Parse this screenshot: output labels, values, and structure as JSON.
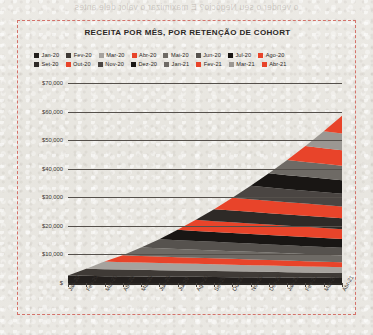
{
  "page": {
    "bleed_text": "o vender o seu Negócio? E maximizar o valor dele antes"
  },
  "chart_frame": {
    "border_color": "#d4726a"
  },
  "legend": {
    "rows": [
      [
        {
          "label": "Jan-20",
          "color": "#231f1d"
        },
        {
          "label": "Fev-20",
          "color": "#3f3a36"
        },
        {
          "label": "Mar-20",
          "color": "#a6a29d"
        },
        {
          "label": "Abr-20",
          "color": "#e8442a"
        },
        {
          "label": "Mai-20",
          "color": "#6e6a65"
        },
        {
          "label": "Jun-20",
          "color": "#56524e"
        },
        {
          "label": "Jul-20",
          "color": "#191614"
        },
        {
          "label": "Ago-20",
          "color": "#e8442a"
        }
      ],
      [
        {
          "label": "Set-20",
          "color": "#2e2a27"
        },
        {
          "label": "Out-20",
          "color": "#e8442a"
        },
        {
          "label": "Nov-20",
          "color": "#4a4542"
        },
        {
          "label": "Dez-20",
          "color": "#191614"
        },
        {
          "label": "Jan-21",
          "color": "#6e6a65"
        },
        {
          "label": "Fev-21",
          "color": "#e8442a"
        },
        {
          "label": "Mar-21",
          "color": "#9b9792"
        },
        {
          "label": "Abr-21",
          "color": "#e8442a"
        }
      ]
    ]
  },
  "chart_data": {
    "type": "area",
    "title": "RECEITA POR MÊS, POR RETENÇÃO DE COHORT",
    "xlabel": "",
    "ylabel": "",
    "ylim": [
      0,
      70000
    ],
    "ytick_labels": [
      "$70,000",
      "$60,000",
      "$50,000",
      "$40,000",
      "$30,000",
      "$20,000",
      "$10,000",
      "$"
    ],
    "ytick_values": [
      70000,
      60000,
      50000,
      40000,
      30000,
      20000,
      10000,
      0
    ],
    "grid": true,
    "legend_position": "top",
    "stacked": true,
    "categories": [
      "Jan-20",
      "Fev-20",
      "Mar-20",
      "Abr-20",
      "Mai-20",
      "Jun-20",
      "Jul-20",
      "Ago-20",
      "Set-20",
      "Out-20",
      "Nov-20",
      "Dez-20",
      "Jan-21",
      "Fev-21",
      "Mar-21",
      "Abr-21"
    ],
    "series": [
      {
        "name": "Jan-20",
        "color": "#231f1d",
        "values": [
          2600,
          2500,
          2400,
          2350,
          2300,
          2250,
          2200,
          2150,
          2100,
          2050,
          2000,
          1950,
          1900,
          1850,
          1800,
          1750
        ]
      },
      {
        "name": "Fev-20",
        "color": "#3f3a36",
        "values": [
          0,
          2500,
          2400,
          2350,
          2300,
          2250,
          2200,
          2150,
          2100,
          2050,
          2000,
          1950,
          1900,
          1850,
          1800,
          1750
        ]
      },
      {
        "name": "Mar-20",
        "color": "#a6a29d",
        "values": [
          0,
          0,
          2700,
          2600,
          2550,
          2500,
          2450,
          2400,
          2350,
          2300,
          2250,
          2200,
          2150,
          2100,
          2050,
          2000
        ]
      },
      {
        "name": "Abr-20",
        "color": "#e8442a",
        "values": [
          0,
          0,
          0,
          2400,
          2300,
          2250,
          2200,
          2150,
          2100,
          2050,
          2000,
          1950,
          1900,
          1850,
          1800,
          1750
        ]
      },
      {
        "name": "Mai-20",
        "color": "#6e6a65",
        "values": [
          0,
          0,
          0,
          0,
          3000,
          2900,
          2850,
          2800,
          2750,
          2700,
          2650,
          2600,
          2550,
          2500,
          2450,
          2400
        ]
      },
      {
        "name": "Jun-20",
        "color": "#56524e",
        "values": [
          0,
          0,
          0,
          0,
          0,
          3200,
          3100,
          3050,
          3000,
          2950,
          2900,
          2850,
          2800,
          2750,
          2700,
          2650
        ]
      },
      {
        "name": "Jul-20",
        "color": "#191614",
        "values": [
          0,
          0,
          0,
          0,
          0,
          0,
          3600,
          3500,
          3450,
          3400,
          3350,
          3300,
          3250,
          3200,
          3150,
          3100
        ]
      },
      {
        "name": "Ago-20",
        "color": "#e8442a",
        "values": [
          0,
          0,
          0,
          0,
          0,
          0,
          0,
          3900,
          3800,
          3750,
          3700,
          3650,
          3600,
          3550,
          3500,
          3450
        ]
      },
      {
        "name": "Set-20",
        "color": "#2e2a27",
        "values": [
          0,
          0,
          0,
          0,
          0,
          0,
          0,
          0,
          4200,
          4100,
          4050,
          4000,
          3950,
          3900,
          3850,
          3800
        ]
      },
      {
        "name": "Out-20",
        "color": "#e8442a",
        "values": [
          0,
          0,
          0,
          0,
          0,
          0,
          0,
          0,
          0,
          4500,
          4400,
          4350,
          4300,
          4250,
          4200,
          4150
        ]
      },
      {
        "name": "Nov-20",
        "color": "#4a4542",
        "values": [
          0,
          0,
          0,
          0,
          0,
          0,
          0,
          0,
          0,
          0,
          4700,
          4600,
          4550,
          4500,
          4450,
          4400
        ]
      },
      {
        "name": "Dez-20",
        "color": "#191614",
        "values": [
          0,
          0,
          0,
          0,
          0,
          0,
          0,
          0,
          0,
          0,
          0,
          5000,
          4900,
          4850,
          4800,
          4750
        ]
      },
      {
        "name": "Jan-21",
        "color": "#6e6a65",
        "values": [
          0,
          0,
          0,
          0,
          0,
          0,
          0,
          0,
          0,
          0,
          0,
          0,
          5300,
          5200,
          5150,
          5100
        ]
      },
      {
        "name": "Fev-21",
        "color": "#e8442a",
        "values": [
          0,
          0,
          0,
          0,
          0,
          0,
          0,
          0,
          0,
          0,
          0,
          0,
          0,
          5600,
          5500,
          5450
        ]
      },
      {
        "name": "Mar-21",
        "color": "#9b9792",
        "values": [
          0,
          0,
          0,
          0,
          0,
          0,
          0,
          0,
          0,
          0,
          0,
          0,
          0,
          0,
          5900,
          5800
        ]
      },
      {
        "name": "Abr-21",
        "color": "#e8442a",
        "values": [
          0,
          0,
          0,
          0,
          0,
          0,
          0,
          0,
          0,
          0,
          0,
          0,
          0,
          0,
          0,
          6200
        ]
      }
    ]
  }
}
